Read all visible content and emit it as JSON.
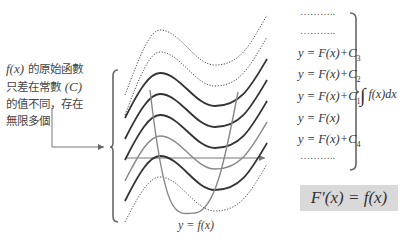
{
  "note": {
    "line1_math": "f(x)",
    "line1_text": " 的原始函數",
    "line2_text": "只差在常數 ",
    "line2_math": "(C)",
    "line3_text": "的值不同，存在",
    "line4_text": "無限多個"
  },
  "curve_labels": [
    {
      "kind": "dots",
      "text": "……….."
    },
    {
      "kind": "dots",
      "text": "……….."
    },
    {
      "kind": "label",
      "prefix": "y = F(x)+C",
      "sub": "3"
    },
    {
      "kind": "label",
      "prefix": "y = F(x)+C",
      "sub": "2"
    },
    {
      "kind": "label",
      "prefix": "y = F(x)+C",
      "sub": "1"
    },
    {
      "kind": "label",
      "prefix": "y = F(x)",
      "sub": ""
    },
    {
      "kind": "label",
      "prefix": "y = F(x)+C",
      "sub": "4"
    },
    {
      "kind": "dots",
      "text": "……….."
    }
  ],
  "integral": {
    "sign": "∫",
    "expr": " f(x)dx"
  },
  "formula_box": {
    "text": "F′(x) = f(x)",
    "bg": "#d9d9d9"
  },
  "fx_label": "y = f(x)",
  "colors": {
    "dark_curve": "#333333",
    "gray_curve": "#888888",
    "axis": "#777777",
    "brace": "#666666"
  }
}
